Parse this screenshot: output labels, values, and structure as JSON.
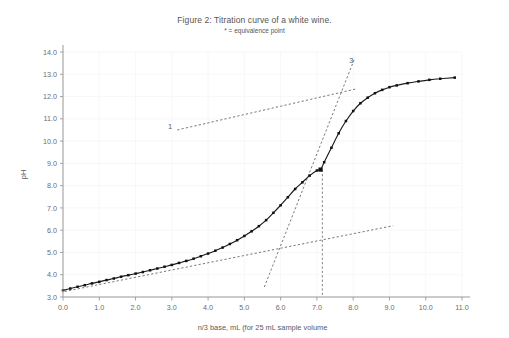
{
  "figure": {
    "title": "Figure 2: Titration curve of a white wine.",
    "subtitle": "* = equivalence point"
  },
  "chart_data": {
    "type": "line",
    "title": "Figure 2: Titration curve of a white wine.",
    "subtitle": "* = equivalence point",
    "xlabel": "n/3 base, mL (for 25 mL sample volume",
    "ylabel": "pH",
    "xlim": [
      0.0,
      11.0
    ],
    "ylim": [
      3.0,
      14.0
    ],
    "xticks": [
      "0.0",
      "1.0",
      "2.0",
      "3.0",
      "4.0",
      "5.0",
      "6.0",
      "7.0",
      "8.0",
      "9.0",
      "10.0",
      "11.0"
    ],
    "yticks": [
      "3.0",
      "4.0",
      "5.0",
      "6.0",
      "7.0",
      "8.0",
      "9.0",
      "10.0",
      "11.0",
      "12.0",
      "13.0",
      "14.0"
    ],
    "grid": true,
    "legend": "none",
    "series": [
      {
        "name": "titration curve",
        "marker": "filled-square",
        "x": [
          0.0,
          0.2,
          0.4,
          0.6,
          0.8,
          1.0,
          1.2,
          1.4,
          1.6,
          1.8,
          2.0,
          2.2,
          2.4,
          2.6,
          2.8,
          3.0,
          3.2,
          3.4,
          3.6,
          3.8,
          4.0,
          4.2,
          4.4,
          4.6,
          4.8,
          5.0,
          5.2,
          5.4,
          5.6,
          5.8,
          6.0,
          6.2,
          6.4,
          6.6,
          6.8,
          7.0,
          7.1,
          7.2,
          7.4,
          7.6,
          7.8,
          8.0,
          8.2,
          8.4,
          8.6,
          8.8,
          9.0,
          9.2,
          9.5,
          9.8,
          10.1,
          10.4,
          10.8
        ],
        "y": [
          3.3,
          3.38,
          3.46,
          3.53,
          3.61,
          3.68,
          3.76,
          3.83,
          3.91,
          3.98,
          4.05,
          4.12,
          4.2,
          4.28,
          4.36,
          4.44,
          4.53,
          4.62,
          4.72,
          4.83,
          4.95,
          5.08,
          5.22,
          5.38,
          5.55,
          5.74,
          5.95,
          6.18,
          6.45,
          6.78,
          7.12,
          7.48,
          7.85,
          8.15,
          8.45,
          8.68,
          8.72,
          9.05,
          9.7,
          10.35,
          10.9,
          11.35,
          11.7,
          11.95,
          12.15,
          12.3,
          12.42,
          12.5,
          12.6,
          12.68,
          12.75,
          12.8,
          12.85
        ]
      }
    ],
    "equivalence_point": {
      "label": "*",
      "x": 7.1,
      "y": 8.72
    },
    "annotations": [
      {
        "label": "1",
        "x": 2.95,
        "y": 10.55,
        "describes": "lower tangent line extrapolation"
      },
      {
        "label": "3",
        "x": 7.95,
        "y": 13.5,
        "describes": "upper tangent line extrapolation"
      }
    ],
    "tangent_lines": [
      {
        "name": "line-1-upper-extrapolation",
        "x0": 3.15,
        "y0": 10.5,
        "x1": 8.1,
        "y1": 12.35
      },
      {
        "name": "line-2-lower-extrapolation",
        "x0": 0.05,
        "y0": 3.25,
        "x1": 9.1,
        "y1": 6.2
      },
      {
        "name": "line-3-steep-tangent",
        "x0": 5.55,
        "y0": 3.45,
        "x1": 8.05,
        "y1": 13.75
      }
    ],
    "drop_line": {
      "name": "equivalence-drop-line",
      "x": 7.15,
      "y_top": 8.72,
      "y_bottom": 3.0
    }
  }
}
